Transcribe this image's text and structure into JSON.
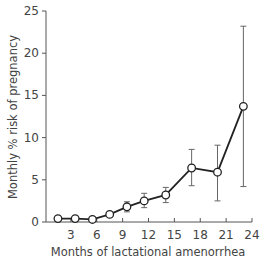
{
  "chart_data": {
    "type": "line",
    "title": "",
    "xlabel": "Months of lactational amenorrhea",
    "ylabel": "Monthly % risk of pregnancy",
    "xlim": [
      0,
      24
    ],
    "ylim": [
      0,
      25
    ],
    "x_ticks": [
      3,
      6,
      9,
      12,
      15,
      18,
      21,
      24
    ],
    "y_ticks": [
      0,
      5,
      10,
      15,
      20,
      25
    ],
    "grid": false,
    "legend": null,
    "series": [
      {
        "name": "Monthly risk of pregnancy",
        "marker": "open-circle",
        "x": [
          1.5,
          3.5,
          5.5,
          7.5,
          9.5,
          11.5,
          14,
          17,
          20,
          23
        ],
        "y": [
          0.4,
          0.4,
          0.3,
          0.9,
          1.8,
          2.5,
          3.2,
          6.4,
          5.9,
          13.7
        ],
        "error_low": [
          null,
          null,
          null,
          null,
          1.2,
          1.7,
          2.3,
          4.3,
          2.5,
          4.2
        ],
        "error_high": [
          null,
          null,
          null,
          null,
          2.4,
          3.4,
          4.1,
          8.6,
          9.1,
          23.2
        ]
      }
    ]
  },
  "labels": {
    "xlabel": "Months of lactational amenorrhea",
    "ylabel": "Monthly % risk of pregnancy"
  }
}
